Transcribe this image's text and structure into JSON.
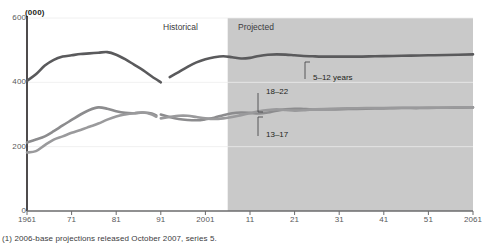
{
  "chart_data": {
    "type": "line",
    "title": "",
    "subtitle": "",
    "unit_label": "(000)",
    "xlabel": "",
    "ylabel": "",
    "xlim": [
      1961,
      2061
    ],
    "ylim": [
      0,
      600
    ],
    "yticks": [
      0,
      200,
      400,
      600
    ],
    "ytick_labels": [
      "0",
      "200",
      "400",
      "600"
    ],
    "xticks": [
      1961,
      1971,
      1981,
      1991,
      2001,
      2011,
      2021,
      2031,
      2041,
      2051,
      2061
    ],
    "xtick_labels": [
      "1961",
      "71",
      "81",
      "91",
      "2001",
      "11",
      "21",
      "31",
      "41",
      "51",
      "2061"
    ],
    "grid": "horizontal-light",
    "legend_position": "inline-annotations",
    "projection_start": 2006,
    "annotations": [
      {
        "name": "historical",
        "text": "Historical",
        "x": 1993,
        "y": 560
      },
      {
        "name": "projected",
        "text": "Projected",
        "x": 2010,
        "y": 560
      }
    ],
    "series": [
      {
        "name": "5-12 years",
        "label": "5–12 years",
        "color": "#5a5a5c",
        "x": [
          1961,
          1963,
          1965,
          1967,
          1969,
          1971,
          1973,
          1975,
          1977,
          1979,
          1981,
          1983,
          1985,
          1987,
          1989,
          1991,
          1991,
          1993,
          1995,
          1997,
          1999,
          2001,
          2003,
          2005,
          2007,
          2009,
          2011,
          2013,
          2015,
          2017,
          2019,
          2021,
          2023,
          2025,
          2027,
          2029,
          2031,
          2035,
          2039,
          2043,
          2047,
          2051,
          2055,
          2061
        ],
        "values": [
          405,
          425,
          452,
          470,
          480,
          484,
          488,
          490,
          492,
          494,
          486,
          472,
          455,
          438,
          418,
          400,
          404,
          416,
          432,
          448,
          462,
          472,
          478,
          481,
          478,
          474,
          476,
          482,
          486,
          487,
          486,
          484,
          482,
          481,
          480,
          480,
          480,
          480,
          481,
          482,
          483,
          484,
          485,
          487
        ],
        "break_after_x": 1991
      },
      {
        "name": "18-22 years",
        "label": "18–22",
        "color": "#8c8c8e",
        "x": [
          1961,
          1963,
          1965,
          1967,
          1969,
          1971,
          1973,
          1975,
          1977,
          1979,
          1981,
          1983,
          1985,
          1987,
          1989,
          1990,
          1991,
          1993,
          1995,
          1997,
          1999,
          2001,
          2003,
          2005,
          2007,
          2009,
          2011,
          2013,
          2015,
          2017,
          2019,
          2021,
          2023,
          2025,
          2029,
          2033,
          2037,
          2041,
          2045,
          2049,
          2053,
          2057,
          2061
        ],
        "values": [
          213,
          222,
          232,
          248,
          266,
          283,
          300,
          314,
          322,
          318,
          310,
          305,
          304,
          306,
          303,
          297,
          300,
          292,
          286,
          283,
          282,
          285,
          290,
          298,
          304,
          306,
          305,
          303,
          306,
          312,
          316,
          318,
          317,
          316,
          316,
          317,
          318,
          319,
          320,
          320,
          321,
          321,
          322
        ],
        "break_after_x": 1990
      },
      {
        "name": "13-17 years",
        "label": "13–17",
        "color": "#9a9a9c",
        "x": [
          1961,
          1963,
          1965,
          1967,
          1969,
          1971,
          1973,
          1975,
          1977,
          1979,
          1981,
          1983,
          1985,
          1987,
          1989,
          1990,
          1991,
          1993,
          1995,
          1997,
          1999,
          2001,
          2003,
          2005,
          2007,
          2009,
          2011,
          2013,
          2015,
          2017,
          2019,
          2021,
          2023,
          2025,
          2029,
          2033,
          2037,
          2041,
          2045,
          2049,
          2053,
          2057,
          2061
        ],
        "values": [
          182,
          186,
          205,
          222,
          232,
          243,
          252,
          262,
          272,
          284,
          294,
          300,
          304,
          306,
          300,
          293,
          288,
          292,
          296,
          296,
          292,
          288,
          286,
          288,
          292,
          298,
          304,
          310,
          314,
          316,
          314,
          312,
          313,
          316,
          318,
          319,
          320,
          320,
          321,
          321,
          321,
          322,
          322
        ],
        "break_after_x": 1990
      }
    ],
    "series_annotations": [
      {
        "name": "label-5-12-years",
        "text": "5–12 years",
        "leader": "up"
      },
      {
        "name": "label-18-22",
        "text": "18–22",
        "leader": "down"
      },
      {
        "name": "label-13-17",
        "text": "13–17",
        "leader": "up"
      }
    ],
    "footnote": "(1) 2006-base projections released October 2007, series 5.",
    "colors": {
      "projected_band": "#c9c9c9",
      "axis": "#231f20",
      "grid": "#ececec",
      "tick_text": "#58595b"
    }
  }
}
